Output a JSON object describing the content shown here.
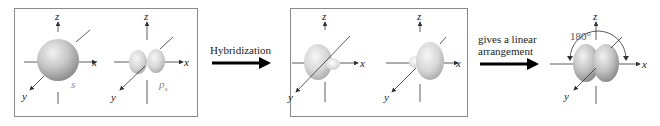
{
  "diagram": {
    "panels": [
      {
        "id": "atomic-orbitals",
        "orbitals": [
          {
            "type": "s",
            "label": "s",
            "axes": {
              "x": "x",
              "y": "y",
              "z": "z"
            }
          },
          {
            "type": "p",
            "label": "p",
            "subscript": "x",
            "axes": {
              "x": "x",
              "y": "y",
              "z": "z"
            }
          }
        ]
      },
      {
        "id": "hybrid-orbitals",
        "orbitals": [
          {
            "type": "sp",
            "direction": "-x",
            "axes": {
              "x": "x",
              "y": "y",
              "z": "z"
            }
          },
          {
            "type": "sp",
            "direction": "+x",
            "axes": {
              "x": "x",
              "y": "y",
              "z": "z"
            }
          }
        ]
      },
      {
        "id": "combined",
        "orbitals": [
          {
            "type": "sp-pair",
            "axes": {
              "x": "x",
              "y": "y",
              "z": "z"
            },
            "angle_label": "180°"
          }
        ]
      }
    ],
    "arrows": [
      {
        "label": "Hybridization"
      },
      {
        "label_line1": "gives a linear",
        "label_line2": "arrangement"
      }
    ],
    "colors": {
      "orbital_fill": "#c8c8c8",
      "orbital_highlight": "#eeeeee",
      "orbital_shadow": "#8e8e8e",
      "axis": "#333333",
      "panel_border": "#8a8a8a",
      "arrow": "#000000"
    }
  }
}
